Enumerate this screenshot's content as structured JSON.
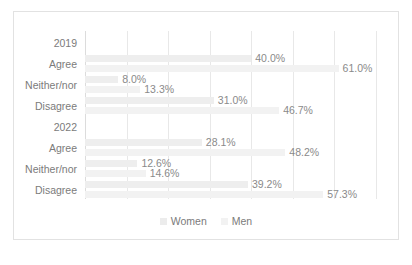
{
  "chart_data": {
    "type": "bar",
    "orientation": "horizontal",
    "title": "",
    "xlabel": "",
    "ylabel": "",
    "xlim": [
      0,
      70
    ],
    "grid": true,
    "gridline_values": [
      0,
      10,
      20,
      30,
      40,
      50,
      60,
      70
    ],
    "legend_position": "bottom",
    "categories": [
      "2019",
      "Agree",
      "Neither/nor",
      "Disagree",
      "2022",
      "Agree",
      "Neither/nor",
      "Disagree"
    ],
    "group_rows": [
      "2019",
      "2022"
    ],
    "series": [
      {
        "name": "Women",
        "color": "#ececec",
        "values": [
          null,
          40.0,
          8.0,
          31.0,
          null,
          28.1,
          12.6,
          39.2
        ],
        "labels": [
          "",
          "40.0%",
          "8.0%",
          "31.0%",
          "",
          "28.1%",
          "12.6%",
          "39.2%"
        ]
      },
      {
        "name": "Men",
        "color": "#f2f2f2",
        "values": [
          null,
          61.0,
          13.3,
          46.7,
          null,
          48.2,
          14.6,
          57.3
        ],
        "labels": [
          "",
          "61.0%",
          "13.3%",
          "46.7%",
          "",
          "48.2%",
          "14.6%",
          "57.3%"
        ]
      }
    ]
  },
  "legend": {
    "items": [
      {
        "label": "Women"
      },
      {
        "label": "Men"
      }
    ]
  },
  "rows": [
    {
      "label": "2019",
      "group": true
    },
    {
      "label": "Agree",
      "group": false,
      "women": "40.0%",
      "men": "61.0%"
    },
    {
      "label": "Neither/nor",
      "group": false,
      "women": "8.0%",
      "men": "13.3%"
    },
    {
      "label": "Disagree",
      "group": false,
      "women": "31.0%",
      "men": "46.7%"
    },
    {
      "label": "2022",
      "group": true
    },
    {
      "label": "Agree",
      "group": false,
      "women": "28.1%",
      "men": "48.2%"
    },
    {
      "label": "Neither/nor",
      "group": false,
      "women": "12.6%",
      "men": "14.6%"
    },
    {
      "label": "Disagree",
      "group": false,
      "women": "39.2%",
      "men": "57.3%"
    }
  ],
  "caption": ""
}
